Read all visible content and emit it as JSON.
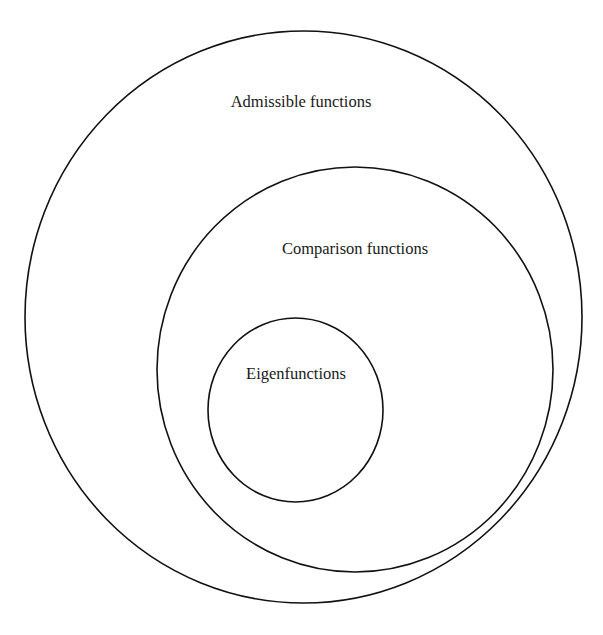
{
  "diagram": {
    "type": "nested-sets",
    "background": "#ffffff",
    "stroke_color": "#111111",
    "text_color": "#1a1a1a",
    "sets": [
      {
        "id": "admissible",
        "label": "Admissible functions",
        "ellipse": {
          "cx": 303.5,
          "cy": 317,
          "rx": 278.5,
          "ry": 286
        },
        "label_pos": {
          "x": 301,
          "y": 107
        }
      },
      {
        "id": "comparison",
        "label": "Comparison functions",
        "ellipse": {
          "cx": 355,
          "cy": 369.5,
          "rx": 198,
          "ry": 202.5
        },
        "label_pos": {
          "x": 355,
          "y": 254
        }
      },
      {
        "id": "eigen",
        "label": "Eigenfunctions",
        "ellipse": {
          "cx": 295.5,
          "cy": 410,
          "rx": 87.5,
          "ry": 92
        },
        "label_pos": {
          "x": 296,
          "y": 379
        }
      }
    ],
    "relations": [
      {
        "subset": "Eigenfunctions",
        "superset": "Comparison functions"
      },
      {
        "subset": "Comparison functions",
        "superset": "Admissible functions"
      }
    ]
  }
}
